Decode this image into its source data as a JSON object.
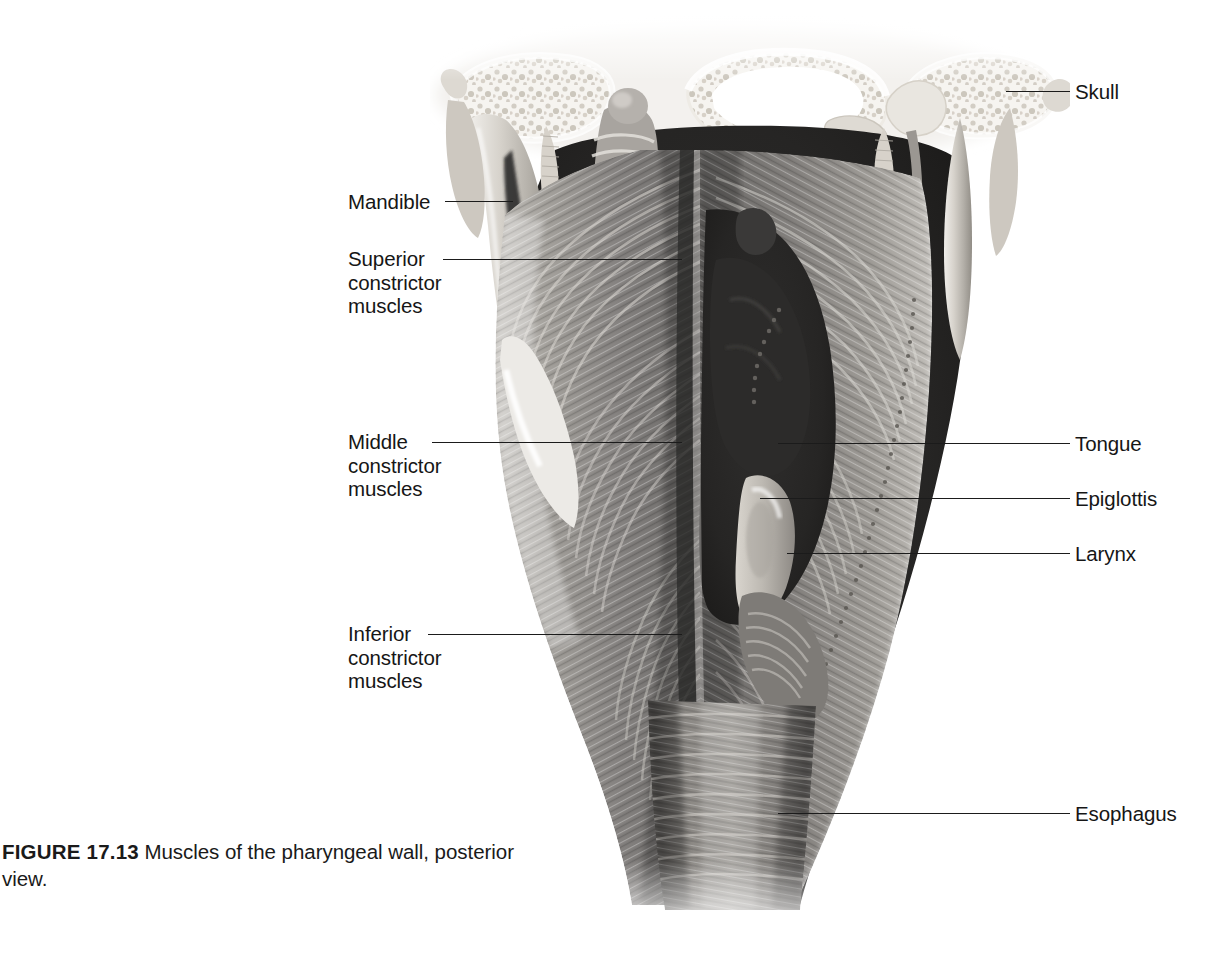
{
  "figure": {
    "number_label": "FIGURE 17.13",
    "caption_text": "  Muscles of the pharyngeal wall, posterior view.",
    "title": "Muscles of the pharyngeal wall, posterior view.",
    "view": "posterior view",
    "illustration_type": "grayscale anatomical airbrush illustration"
  },
  "colors": {
    "page_background": "#ffffff",
    "leader_line": "#1b1b1b",
    "label_text": "#161616",
    "caption_text": "#1a1a1a",
    "bone_light": "#f2f0ec",
    "bone_mid": "#d8d4cc",
    "bone_shadow": "#b4aea4",
    "muscle_light": "#b9b6b1",
    "muscle_mid": "#8d8a86",
    "muscle_dark": "#63615e",
    "cavity_dark": "#2b2a29",
    "cavity_black": "#1a1a1a"
  },
  "labels": {
    "left": [
      {
        "id": "mandible",
        "text": "Mandible",
        "lines": [
          "Mandible"
        ],
        "text_x": 348,
        "text_y": 190,
        "leader_x": 445,
        "leader_y": 201,
        "leader_w": 68
      },
      {
        "id": "superior-constrictor-muscles",
        "text": "Superior constrictor muscles",
        "lines": [
          "Superior",
          "constrictor",
          "muscles"
        ],
        "text_x": 348,
        "text_y": 247,
        "leader_x": 443,
        "leader_y": 259,
        "leader_w": 239
      },
      {
        "id": "middle-constrictor-muscles",
        "text": "Middle constrictor muscles",
        "lines": [
          "Middle",
          "constrictor",
          "muscles"
        ],
        "text_x": 348,
        "text_y": 430,
        "leader_x": 432,
        "leader_y": 442,
        "leader_w": 250
      },
      {
        "id": "inferior-constrictor-muscles",
        "text": "Inferior constrictor muscles",
        "lines": [
          "Inferior",
          "constrictor",
          "muscles"
        ],
        "text_x": 348,
        "text_y": 622,
        "leader_x": 428,
        "leader_y": 634,
        "leader_w": 254
      }
    ],
    "right": [
      {
        "id": "skull",
        "text": "Skull",
        "lines": [
          "Skull"
        ],
        "text_x": 1075,
        "text_y": 80,
        "leader_x": 1006,
        "leader_y": 91,
        "leader_w": 64
      },
      {
        "id": "tongue",
        "text": "Tongue",
        "lines": [
          "Tongue"
        ],
        "text_x": 1075,
        "text_y": 432,
        "leader_x": 778,
        "leader_y": 443,
        "leader_w": 292
      },
      {
        "id": "epiglottis",
        "text": "Epiglottis",
        "lines": [
          "Epiglottis"
        ],
        "text_x": 1075,
        "text_y": 487,
        "leader_x": 760,
        "leader_y": 498,
        "leader_w": 310
      },
      {
        "id": "larynx",
        "text": "Larynx",
        "lines": [
          "Larynx"
        ],
        "text_x": 1075,
        "text_y": 542,
        "leader_x": 787,
        "leader_y": 553,
        "leader_w": 283
      },
      {
        "id": "esophagus",
        "text": "Esophagus",
        "lines": [
          "Esophagus"
        ],
        "text_x": 1075,
        "text_y": 802,
        "leader_x": 778,
        "leader_y": 813,
        "leader_w": 292
      }
    ]
  },
  "anatomy_parts": [
    "skull base with cancellous bone",
    "mandible ramus",
    "superior pharyngeal constrictor muscle",
    "middle pharyngeal constrictor muscle",
    "inferior pharyngeal constrictor muscle",
    "pharyngeal raphe",
    "tongue root",
    "epiglottis",
    "larynx",
    "esophagus",
    "styloid process",
    "stylopharyngeus muscle"
  ]
}
